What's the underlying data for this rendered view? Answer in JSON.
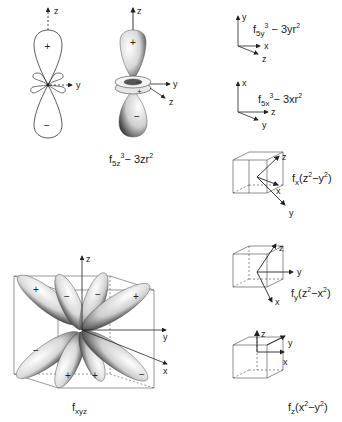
{
  "figure": {
    "colors": {
      "ink": "#222222",
      "paper": "#ffffff",
      "shade": "#555555"
    }
  },
  "panels": [
    {
      "id": "f5z3-2d",
      "description": "cross-section outline of f5z3-3zr2",
      "axes": {
        "vertical": "z",
        "horizontal": "y"
      },
      "signs": {
        "upper_lobe": "+",
        "lower_lobe": "−",
        "small_upper_left": "−",
        "small_upper_right": "−",
        "small_lower_left": "+",
        "small_lower_right": "+"
      }
    },
    {
      "id": "f5z3-3d",
      "axes": {
        "up": "z",
        "right": "y",
        "diagonal": "z"
      },
      "signs": {
        "upper_lobe": "+",
        "ring_top": "−",
        "ring_bottom": "+",
        "lower_lobe": "−"
      },
      "caption": {
        "base": "f",
        "sub": "5z",
        "sup1": "3",
        "mid": "− 3zr",
        "sup2": "2"
      }
    },
    {
      "id": "f5y3",
      "axes": {
        "up": "y",
        "right": "x",
        "diagonal": "z"
      },
      "caption": {
        "base": "f",
        "sub": "5y",
        "sup1": "3",
        "mid": " − 3yr",
        "sup2": "2"
      }
    },
    {
      "id": "f5x3",
      "axes": {
        "up": "x",
        "right": "z",
        "diagonal": "y"
      },
      "caption": {
        "base": "f",
        "sub": "5x",
        "sup1": "3",
        "mid": "− 3xr",
        "sup2": "2"
      }
    },
    {
      "id": "fx(z2-y2)",
      "axes": {
        "a": "z",
        "b": "x",
        "c": "y"
      },
      "caption": {
        "base": "f",
        "sub": "x",
        "paren1": "(z",
        "sup1": "2",
        "mid": "−y",
        "sup2": "2",
        "paren2": ")"
      }
    },
    {
      "id": "fy(z2-x2)",
      "axes": {
        "a": "z",
        "b": "y",
        "c": "x"
      },
      "caption": {
        "base": "f",
        "sub": "y",
        "paren1": "(z",
        "sup1": "2",
        "mid": "−x",
        "sup2": "2",
        "paren2": ")"
      }
    },
    {
      "id": "fxyz",
      "axes": {
        "up": "z",
        "right": "y",
        "diagonal": "x"
      },
      "signs": [
        "+",
        "−",
        "−",
        "+",
        "−",
        "+",
        "+",
        "−"
      ],
      "caption": {
        "base": "f",
        "sub": "xyz"
      }
    },
    {
      "id": "fz(x2-y2)",
      "axes": {
        "up": "z",
        "right": "y",
        "diagonal": "x"
      },
      "caption": {
        "base": "f",
        "sub": "z",
        "paren1": "(x",
        "sup1": "2",
        "mid": "−y",
        "sup2": "2",
        "paren2": ")"
      }
    }
  ]
}
